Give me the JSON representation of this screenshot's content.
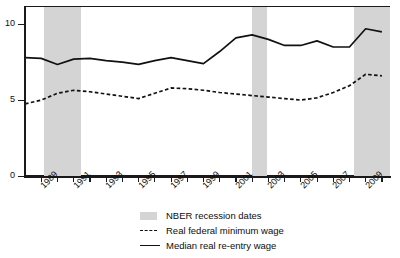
{
  "chart_data": {
    "type": "line",
    "title": "",
    "xlabel": "",
    "ylabel": "",
    "ylim": [
      0,
      11.2
    ],
    "xlim": [
      1988,
      2010.5
    ],
    "yticks": [
      "0",
      "5",
      "10"
    ],
    "ytick_values": [
      0,
      5,
      10
    ],
    "xticks": [
      "1989",
      "1991",
      "1993",
      "1995",
      "1997",
      "1999",
      "2001",
      "2003",
      "2005",
      "2007",
      "2009"
    ],
    "xtick_values": [
      1989,
      1991,
      1993,
      1995,
      1997,
      1999,
      2001,
      2003,
      2005,
      2007,
      2009
    ],
    "grid": false,
    "legend_position": "bottom-center",
    "x": [
      1988,
      1989,
      1990,
      1991,
      1992,
      1993,
      1994,
      1995,
      1996,
      1997,
      1998,
      1999,
      2000,
      2001,
      2002,
      2003,
      2004,
      2005,
      2006,
      2007,
      2008,
      2009,
      2010
    ],
    "series": [
      {
        "name": "Median real re-entry wage",
        "style": "solid",
        "color": "#111111",
        "values": [
          7.8,
          7.75,
          7.35,
          7.7,
          7.75,
          7.6,
          7.5,
          7.35,
          7.6,
          7.8,
          7.6,
          7.4,
          8.2,
          9.1,
          9.3,
          9.0,
          8.6,
          8.6,
          8.9,
          8.5,
          8.5,
          9.7,
          9.5
        ]
      },
      {
        "name": "Real federal minimum wage",
        "style": "dashed",
        "color": "#111111",
        "values": [
          4.75,
          5.0,
          5.45,
          5.65,
          5.55,
          5.4,
          5.25,
          5.1,
          5.45,
          5.8,
          5.75,
          5.65,
          5.5,
          5.4,
          5.3,
          5.2,
          5.1,
          5.0,
          5.15,
          5.5,
          5.95,
          6.7,
          6.6
        ]
      }
    ],
    "recession_bands": [
      {
        "label": "1990-1991 recession",
        "start": 1989.2,
        "end": 1991.45
      },
      {
        "label": "2001 recession",
        "start": 2002.0,
        "end": 2002.9
      },
      {
        "label": "2007-2009 recession",
        "start": 2008.3,
        "end": 2010.5
      }
    ],
    "legend": [
      {
        "key": "recession",
        "label": "NBER recession dates",
        "marker": "band"
      },
      {
        "key": "minwage",
        "label": "Real federal minimum wage",
        "marker": "dashed-line"
      },
      {
        "key": "reentry",
        "label": "Median real re-entry wage",
        "marker": "solid-line"
      }
    ]
  }
}
